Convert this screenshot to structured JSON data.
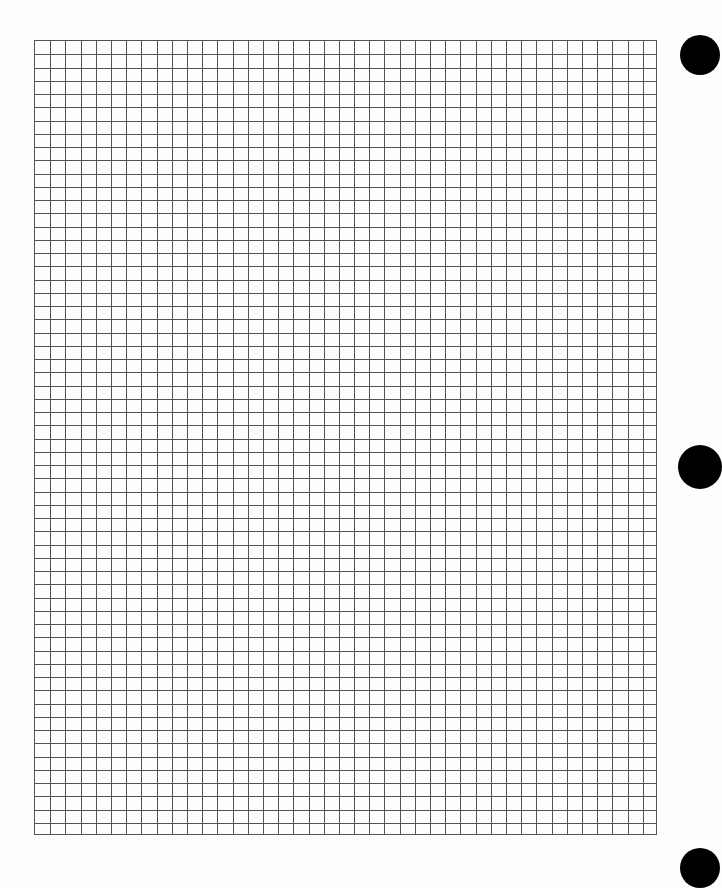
{
  "page": {
    "type": "graph-paper",
    "background": "#fdfdfd",
    "line_color": "#555555"
  },
  "grid": {
    "left": 34,
    "top": 40,
    "width": 623,
    "height": 795,
    "columns": 41,
    "rows": 60
  },
  "punch_holes": [
    {
      "cx": 700,
      "cy": 55,
      "r": 20
    },
    {
      "cx": 700,
      "cy": 467,
      "r": 22
    },
    {
      "cx": 700,
      "cy": 868,
      "r": 20
    }
  ]
}
